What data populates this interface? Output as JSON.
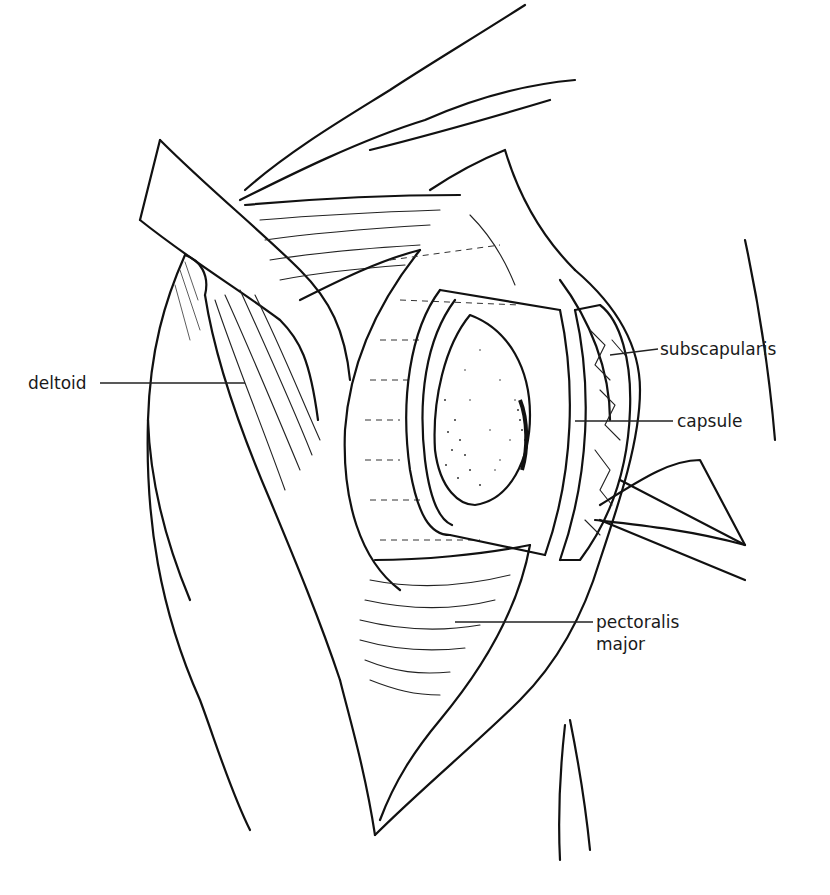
{
  "figure": {
    "type": "anatomical line illustration",
    "labels": [
      {
        "id": "deltoid",
        "text": "deltoid"
      },
      {
        "id": "subscapularis",
        "text": "subscapularis"
      },
      {
        "id": "capsule",
        "text": "capsule"
      },
      {
        "id": "pectoralis_major",
        "line1": "pectoralis",
        "line2": "major"
      }
    ]
  }
}
